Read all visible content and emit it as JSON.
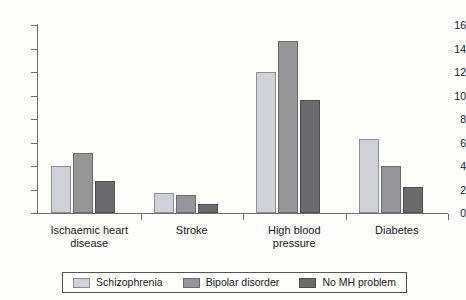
{
  "chart_data": {
    "type": "bar",
    "title": "",
    "subtitle": "",
    "xlabel": "",
    "ylabel": "",
    "ylim": [
      0,
      16
    ],
    "yticks": [
      0,
      2,
      4,
      6,
      8,
      10,
      12,
      14,
      16
    ],
    "grid": false,
    "legend_position": "bottom",
    "categories": [
      "Ischaemic heart disease",
      "Stroke",
      "High blood pressure",
      "Diabetes"
    ],
    "category_lines": [
      [
        "Ischaemic heart",
        "disease"
      ],
      [
        "Stroke"
      ],
      [
        "High blood",
        "pressure"
      ],
      [
        "Diabetes"
      ]
    ],
    "series": [
      {
        "name": "Schizophrenia",
        "color": "#cfd1d6",
        "border": "#8d8f95",
        "values": [
          4.0,
          1.7,
          12.0,
          6.3
        ]
      },
      {
        "name": "Bipolar disorder",
        "color": "#959598",
        "border": "#6a6a6c",
        "values": [
          5.1,
          1.5,
          14.6,
          4.0
        ]
      },
      {
        "name": "No MH problem",
        "color": "#6b6b6d",
        "border": "#4e4e50",
        "values": [
          2.7,
          0.8,
          9.6,
          2.2
        ]
      }
    ]
  }
}
